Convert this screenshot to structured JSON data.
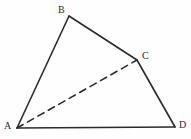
{
  "figure": {
    "kind": "geometry-diagram",
    "background_color": "#fefefe",
    "stroke_color": "#2b2b2b",
    "solid_stroke_width": 1.6,
    "dashed_stroke_width": 1.6,
    "dash_pattern": "7 5",
    "canvas": {
      "width": 191,
      "height": 139
    },
    "vertices": [
      {
        "id": "A",
        "label": "A",
        "x": 17,
        "y": 128,
        "label_x": 4,
        "label_y": 121
      },
      {
        "id": "B",
        "label": "B",
        "x": 69,
        "y": 16,
        "label_x": 58,
        "label_y": 5
      },
      {
        "id": "C",
        "label": "C",
        "x": 137,
        "y": 60,
        "label_x": 142,
        "label_y": 51
      },
      {
        "id": "D",
        "label": "D",
        "x": 175,
        "y": 127,
        "label_x": 179,
        "label_y": 120
      }
    ],
    "edges": [
      {
        "id": "AB",
        "from": "A",
        "to": "B",
        "style": "solid",
        "x1": 17,
        "y1": 128,
        "x2": 69,
        "y2": 16
      },
      {
        "id": "BC",
        "from": "B",
        "to": "C",
        "style": "solid",
        "x1": 69,
        "y1": 16,
        "x2": 137,
        "y2": 60
      },
      {
        "id": "CD",
        "from": "C",
        "to": "D",
        "style": "solid",
        "x1": 137,
        "y1": 60,
        "x2": 175,
        "y2": 127
      },
      {
        "id": "AD",
        "from": "A",
        "to": "D",
        "style": "solid",
        "x1": 17,
        "y1": 128,
        "x2": 175,
        "y2": 127
      },
      {
        "id": "AC",
        "from": "A",
        "to": "C",
        "style": "dashed",
        "x1": 17,
        "y1": 128,
        "x2": 137,
        "y2": 60
      }
    ]
  }
}
